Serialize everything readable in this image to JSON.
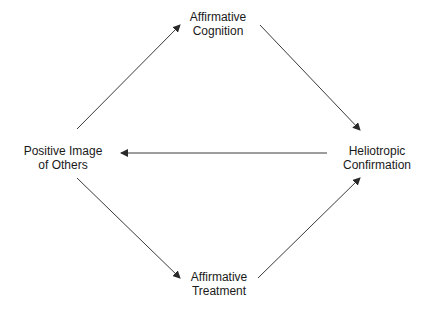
{
  "diagram": {
    "type": "cycle-flow",
    "colors": {
      "line": "#3a3a3a",
      "text": "#1a1a1a",
      "background": "#ffffff"
    },
    "nodes": {
      "cognition": {
        "id": "cognition",
        "line1": "Affirmative",
        "line2": "Cognition",
        "position": "top"
      },
      "positive_image": {
        "id": "positive_image",
        "line1": "Positive Image",
        "line2": "of Others",
        "position": "left"
      },
      "confirmation": {
        "id": "confirmation",
        "line1": "Heliotropic",
        "line2": "Confirmation",
        "position": "right"
      },
      "treatment": {
        "id": "treatment",
        "line1": "Affirmative",
        "line2": "Treatment",
        "position": "bottom"
      }
    },
    "edges": [
      {
        "from": "positive_image",
        "to": "cognition"
      },
      {
        "from": "cognition",
        "to": "confirmation"
      },
      {
        "from": "confirmation",
        "to": "positive_image"
      },
      {
        "from": "positive_image",
        "to": "treatment"
      },
      {
        "from": "treatment",
        "to": "confirmation"
      }
    ]
  }
}
